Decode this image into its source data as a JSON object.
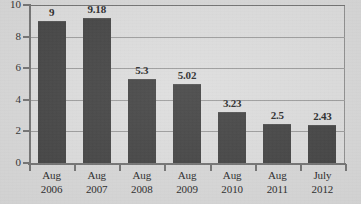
{
  "chart_data": {
    "type": "bar",
    "title": "",
    "subtitle": "",
    "xlabel": "",
    "ylabel": "",
    "categories": [
      "Aug 2006",
      "Aug 2007",
      "Aug 2008",
      "Aug 2009",
      "Aug 2010",
      "Aug 2011",
      "July 2012"
    ],
    "category_lines": [
      [
        "Aug",
        "2006"
      ],
      [
        "Aug",
        "2007"
      ],
      [
        "Aug",
        "2008"
      ],
      [
        "Aug",
        "2009"
      ],
      [
        "Aug",
        "2010"
      ],
      [
        "Aug",
        "2011"
      ],
      [
        "July",
        "2012"
      ]
    ],
    "values": [
      9,
      9.18,
      5.3,
      5.02,
      3.23,
      2.5,
      2.43
    ],
    "value_labels": [
      "9",
      "9.18",
      "5.3",
      "5.02",
      "3.23",
      "2.5",
      "2.43"
    ],
    "ylim": [
      0,
      10
    ],
    "y_ticks": [
      0,
      2,
      4,
      6,
      8,
      10
    ],
    "y_tick_labels": [
      "0",
      "2",
      "4",
      "6",
      "8",
      "10"
    ],
    "grid": true,
    "grid_axis": "y",
    "legend": false,
    "legend_position": "none",
    "bar_color": "#3e3e3e",
    "plot_background": "#dcdcdc",
    "page_background": "#d7d7d7",
    "grid_color": "#9a9a9a",
    "axis_color": "#6f6f6f",
    "text_color": "#232323"
  }
}
